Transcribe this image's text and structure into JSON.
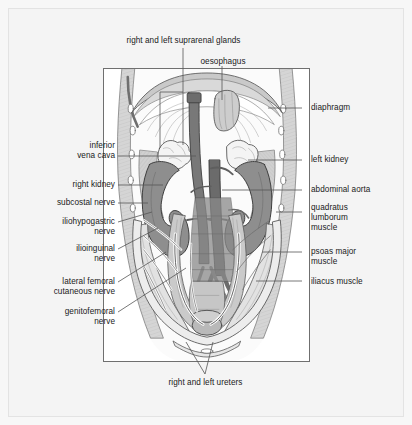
{
  "figure": {
    "background_color": "#f7f7f7",
    "panel_background": "#ffffff",
    "frame_color": "#6f6f6f",
    "leader_color": "#555555",
    "text_color": "#1a1a1a"
  },
  "labels": {
    "suprarenal_glands": "right and left suprarenal glands",
    "oesophagus": "oesophagus",
    "diaphragm": "diaphragm",
    "inferior_vena_cava_line1": "inferior",
    "inferior_vena_cava_line2": "vena cava",
    "right_kidney": "right kidney",
    "left_kidney": "left kidney",
    "abdominal_aorta": "abdominal aorta",
    "subcostal_nerve": "subcostal nerve",
    "iliohypogastric_line1": "iliohypogastric",
    "iliohypogastric_line2": "nerve",
    "ilioinguinal_line1": "ilioinguinal",
    "ilioinguinal_line2": "nerve",
    "lateral_femoral_line1": "lateral femoral",
    "lateral_femoral_line2": "cutaneous nerve",
    "genitofemoral_line1": "genitofemoral",
    "genitofemoral_line2": "nerve",
    "quadratus_line1": "quadratus",
    "quadratus_line2": "lumborum",
    "quadratus_line3": "muscle",
    "psoas_line1": "psoas major",
    "psoas_line2": "muscle",
    "iliacus": "iliacus muscle",
    "ureters": "right and left ureters"
  },
  "anatomy_colors": {
    "kidney": "#8e8e8e",
    "kidney_shade": "#7d7d7d",
    "vessel_dark": "#6f6f6f",
    "vessel_mid": "#7a7a7a",
    "muscle_light": "#d8d8d8",
    "muscle_mid": "#c4c4c4",
    "diaphragm": "#cfcfcf",
    "bone": "#e8e8e8",
    "suprarenal": "#f2f2f2",
    "outline": "#3a3a3a",
    "hatch": "#9a9a9a"
  }
}
